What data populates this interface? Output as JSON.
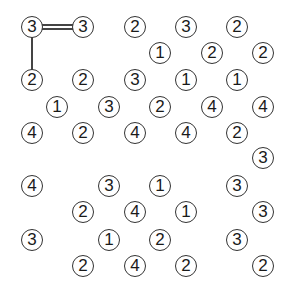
{
  "puzzle": {
    "type": "hashi",
    "islands": [
      {
        "x": 32,
        "y": 27,
        "value": "3"
      },
      {
        "x": 83,
        "y": 27,
        "value": "3"
      },
      {
        "x": 135,
        "y": 27,
        "value": "2"
      },
      {
        "x": 186,
        "y": 27,
        "value": "3"
      },
      {
        "x": 237,
        "y": 27,
        "value": "2"
      },
      {
        "x": 160,
        "y": 53,
        "value": "1"
      },
      {
        "x": 212,
        "y": 53,
        "value": "2"
      },
      {
        "x": 263,
        "y": 53,
        "value": "2"
      },
      {
        "x": 32,
        "y": 80,
        "value": "2"
      },
      {
        "x": 83,
        "y": 80,
        "value": "2"
      },
      {
        "x": 135,
        "y": 80,
        "value": "3"
      },
      {
        "x": 186,
        "y": 80,
        "value": "1"
      },
      {
        "x": 237,
        "y": 80,
        "value": "1"
      },
      {
        "x": 57,
        "y": 107,
        "value": "1"
      },
      {
        "x": 109,
        "y": 107,
        "value": "3"
      },
      {
        "x": 160,
        "y": 107,
        "value": "2"
      },
      {
        "x": 212,
        "y": 107,
        "value": "4"
      },
      {
        "x": 263,
        "y": 107,
        "value": "4"
      },
      {
        "x": 32,
        "y": 133,
        "value": "4"
      },
      {
        "x": 83,
        "y": 133,
        "value": "2"
      },
      {
        "x": 135,
        "y": 133,
        "value": "4"
      },
      {
        "x": 186,
        "y": 133,
        "value": "4"
      },
      {
        "x": 237,
        "y": 133,
        "value": "2"
      },
      {
        "x": 263,
        "y": 158,
        "value": "3"
      },
      {
        "x": 32,
        "y": 186,
        "value": "4"
      },
      {
        "x": 109,
        "y": 186,
        "value": "3"
      },
      {
        "x": 160,
        "y": 186,
        "value": "1"
      },
      {
        "x": 237,
        "y": 186,
        "value": "3"
      },
      {
        "x": 83,
        "y": 212,
        "value": "2"
      },
      {
        "x": 135,
        "y": 212,
        "value": "4"
      },
      {
        "x": 186,
        "y": 212,
        "value": "1"
      },
      {
        "x": 263,
        "y": 212,
        "value": "3"
      },
      {
        "x": 32,
        "y": 240,
        "value": "3"
      },
      {
        "x": 109,
        "y": 240,
        "value": "1"
      },
      {
        "x": 160,
        "y": 240,
        "value": "2"
      },
      {
        "x": 237,
        "y": 240,
        "value": "3"
      },
      {
        "x": 83,
        "y": 266,
        "value": "2"
      },
      {
        "x": 135,
        "y": 266,
        "value": "4"
      },
      {
        "x": 186,
        "y": 266,
        "value": "2"
      },
      {
        "x": 263,
        "y": 266,
        "value": "2"
      }
    ],
    "bridges": [
      {
        "from": 0,
        "to": 1,
        "count": 2,
        "orientation": "horizontal"
      },
      {
        "from": 0,
        "to": 8,
        "count": 1,
        "orientation": "vertical"
      }
    ]
  }
}
